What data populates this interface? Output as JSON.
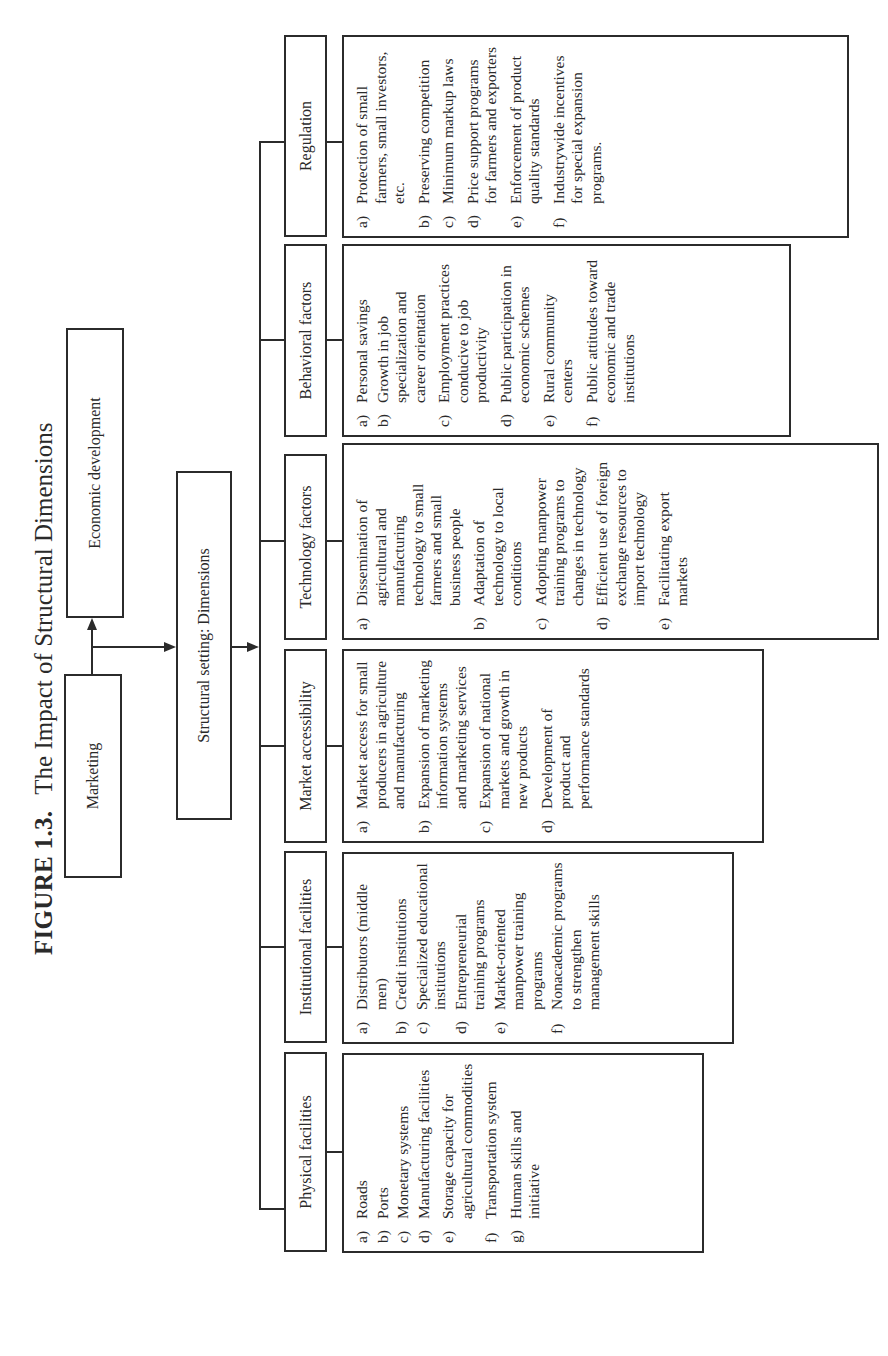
{
  "figure": {
    "number": "FIGURE 1.3.",
    "title": "The Impact of Structural Dimensions"
  },
  "nodes": {
    "marketing": "Marketing",
    "economic_development": "Economic development",
    "structural_setting": "Structural setting: Dimensions"
  },
  "columns": [
    {
      "header": "Physical facilities",
      "items": [
        {
          "label": "a)",
          "text": "Roads"
        },
        {
          "label": "b)",
          "text": "Ports"
        },
        {
          "label": "c)",
          "text": "Monetary systems"
        },
        {
          "label": "d)",
          "text": "Manufacturing facilities"
        },
        {
          "label": "e)",
          "text": "Storage capacity for agricultural commodities"
        },
        {
          "label": "f)",
          "text": "Transportation system"
        },
        {
          "label": "g)",
          "text": "Human skills and initiative"
        }
      ]
    },
    {
      "header": "Institutional facilities",
      "items": [
        {
          "label": "a)",
          "text": "Distributors (middle men)"
        },
        {
          "label": "b)",
          "text": "Credit institutions"
        },
        {
          "label": "c)",
          "text": "Specialized educational institutions"
        },
        {
          "label": "d)",
          "text": "Entrepreneurial training programs"
        },
        {
          "label": "e)",
          "text": "Market-oriented manpower training programs"
        },
        {
          "label": "f)",
          "text": "Nonacademic programs to strengthen management skills"
        }
      ]
    },
    {
      "header": "Market accessibility",
      "items": [
        {
          "label": "a)",
          "text": "Market access for small producers in agriculture and manufacturing"
        },
        {
          "label": "b)",
          "text": "Expansion of marketing information systems and marketing services"
        },
        {
          "label": "c)",
          "text": "Expansion of national markets and growth in new products"
        },
        {
          "label": "d)",
          "text": "Development of product and performance standards"
        }
      ]
    },
    {
      "header": "Technology factors",
      "items": [
        {
          "label": "a)",
          "text": "Dissemination of agricultural and manufacturing technology to small farmers and small business people"
        },
        {
          "label": "b)",
          "text": "Adaptation of technology to local conditions"
        },
        {
          "label": "c)",
          "text": "Adopting manpower training programs to changes in technology"
        },
        {
          "label": "d)",
          "text": "Efficient use of foreign exchange resources to import technology"
        },
        {
          "label": "e)",
          "text": "Facilitating export markets"
        }
      ]
    },
    {
      "header": "Behavioral factors",
      "items": [
        {
          "label": "a)",
          "text": "Personal savings"
        },
        {
          "label": "b)",
          "text": "Growth in job specialization and career orientation"
        },
        {
          "label": "c)",
          "text": "Employment practices conducive to job productivity"
        },
        {
          "label": "d)",
          "text": "Public participation in economic schemes"
        },
        {
          "label": "e)",
          "text": "Rural community centers"
        },
        {
          "label": "f)",
          "text": "Public attitudes toward economic and trade institutions"
        }
      ]
    },
    {
      "header": "Regulation",
      "items": [
        {
          "label": "a)",
          "text": "Protection of small farmers, small investors, etc."
        },
        {
          "label": "b)",
          "text": "Preserving competition"
        },
        {
          "label": "c)",
          "text": "Minimum markup laws"
        },
        {
          "label": "d)",
          "text": "Price support programs for farmers and exporters"
        },
        {
          "label": "e)",
          "text": "Enforcement of product quality standards"
        },
        {
          "label": "f)",
          "text": "Industrywide incentives for special expansion programs."
        }
      ]
    }
  ],
  "colors": {
    "line": "#2b2b2b",
    "text": "#2a2a2a",
    "background": "#ffffff"
  },
  "orientation": "rotated 90 degrees counter-clockwise"
}
